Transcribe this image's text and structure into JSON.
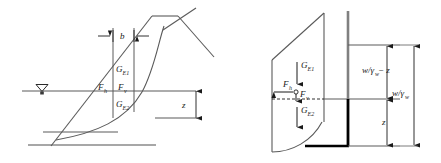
{
  "figure": {
    "colors": {
      "line": "#5a5a5a",
      "line_dark": "#1a1a1a",
      "wall_grey": "#808080",
      "wall_black": "#000000",
      "background": "#ffffff"
    }
  },
  "left_panel": {
    "name": "embankment-cross-section",
    "labels": {
      "width_b": "b",
      "force_gE1": "G",
      "force_gE1_sub": "E1",
      "force_gE2": "G",
      "force_gE2_sub": "E2",
      "force_fh": "F",
      "force_fh_sub": "h",
      "force_fv": "F",
      "force_fv_sub": "v",
      "depth_z": "z"
    },
    "water_table_symbol": "water-table-triangle"
  },
  "right_panel": {
    "name": "retaining-wall-free-body",
    "labels": {
      "force_gE1": "G",
      "force_gE1_sub": "E1",
      "force_gE2": "G",
      "force_gE2_sub": "E2",
      "force_fh": "F",
      "force_fh_sub": "h",
      "force_fv": "F",
      "force_fv_sub": "v",
      "dim_upper": "w/γ",
      "dim_upper_sub": "w",
      "dim_upper_tail": "− z",
      "dim_total": "w/γ",
      "dim_total_sub": "w",
      "dim_lower": "z"
    }
  }
}
